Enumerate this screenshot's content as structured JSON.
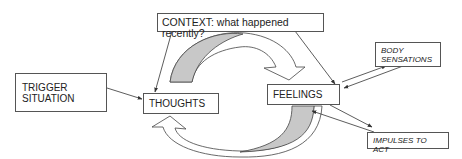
{
  "diagram": {
    "colors": {
      "stroke": "#444444",
      "cycle_fill_shaded": "#c8c8c8",
      "cycle_fill_white": "#ffffff",
      "box_border": "#555555"
    },
    "nodes": {
      "context": {
        "label": "CONTEXT: what happened recently?"
      },
      "trigger": {
        "line1": "TRIGGER",
        "line2": "SITUATION"
      },
      "thoughts": {
        "label": "THOUGHTS"
      },
      "feelings": {
        "label": "FEELINGS"
      },
      "body": {
        "line1": "BODY",
        "line2": "SENSATIONS"
      },
      "impulses": {
        "label": "IMPULSES TO ACT"
      }
    },
    "edges": [
      {
        "from": "context",
        "to": "thoughts"
      },
      {
        "from": "context",
        "to": "feelings"
      },
      {
        "from": "trigger",
        "to": "thoughts"
      },
      {
        "from": "thoughts",
        "to": "feelings",
        "type": "curved-cycle-arrow"
      },
      {
        "from": "feelings",
        "to": "thoughts",
        "type": "curved-cycle-arrow"
      },
      {
        "from": "feelings",
        "to": "body",
        "type": "bidirectional"
      },
      {
        "from": "feelings",
        "to": "impulses",
        "type": "bidirectional"
      }
    ]
  }
}
